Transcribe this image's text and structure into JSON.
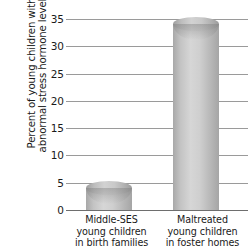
{
  "chart_data": {
    "type": "bar",
    "title": "",
    "xlabel": "",
    "ylabel": "Percent of young children with abnormal stress hormone levels",
    "ylabel_lines": [
      "Percent of young children with",
      "abnormal stress hormone levels"
    ],
    "categories": [
      "Middle-SES young children in birth families",
      "Maltreated young children in foster homes"
    ],
    "category_lines": [
      [
        "Middle-SES",
        "young children",
        "in birth families"
      ],
      [
        "Maltreated",
        "young children",
        "in foster homes"
      ]
    ],
    "values": [
      4,
      34
    ],
    "ylim": [
      0,
      35
    ],
    "yticks": [
      0,
      5,
      10,
      15,
      20,
      25,
      30,
      35
    ],
    "ytick_labels": [
      "0",
      "5",
      "10",
      "15",
      "20",
      "25",
      "30",
      "35"
    ],
    "grid": true,
    "legend": "none",
    "bar_style": "3d-cylinder",
    "colors": {
      "bar_light": "#d6d6d6",
      "bar_mid": "#bdbdbd",
      "bar_dark": "#a5a5a5",
      "gridline": "#9a9a9a",
      "axis": "#6e6e6e",
      "text": "#1a1a1a",
      "background": "#ffffff"
    }
  }
}
